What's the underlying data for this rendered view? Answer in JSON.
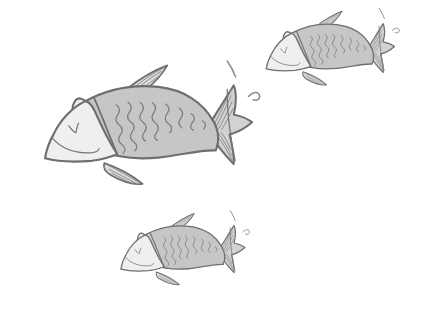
{
  "scene": {
    "title": "Three Fish Sketch",
    "background_color": "#ffffff",
    "width": 429,
    "height": 318,
    "style": "hand-drawn pencil sketch",
    "subject_count": 3
  },
  "palette": {
    "background": "#ffffff",
    "outline": "#6e6e6e",
    "body_fill": "#c6c6c6",
    "head_fill": "#efefef",
    "fin_fill": "#dcdcdc",
    "tail_fill": "#d2d2d2",
    "detail_line": "#7d7d7d",
    "splash_line": "#8d8d8d"
  },
  "fish": [
    {
      "id": "fish-large-left",
      "label": "Large fish, center left",
      "x": 27,
      "y": 73,
      "scale": 1.0,
      "rotation": -8,
      "facing": "left"
    },
    {
      "id": "fish-small-top-right",
      "label": "Small fish, top right",
      "x": 255,
      "y": 16,
      "scale": 0.62,
      "rotation": -8,
      "facing": "left"
    },
    {
      "id": "fish-small-bottom",
      "label": "Small fish, bottom center",
      "x": 110,
      "y": 218,
      "scale": 0.6,
      "rotation": -8,
      "facing": "left"
    }
  ],
  "fish_parts": [
    {
      "name": "head",
      "description": "pale rounded snout section"
    },
    {
      "name": "eye",
      "description": "small v-shaped check mark"
    },
    {
      "name": "mouth",
      "description": "curved smile line"
    },
    {
      "name": "gill-divider",
      "description": "vertical line separating head from body"
    },
    {
      "name": "body",
      "description": "gray tapering body with scale squiggles"
    },
    {
      "name": "scales",
      "description": "vertical zigzag squiggle columns"
    },
    {
      "name": "dorsal-fin",
      "description": "small swept triangular fin on top"
    },
    {
      "name": "pectoral-fin",
      "description": "pointed leaf-shaped fin below body"
    },
    {
      "name": "tail-fin",
      "description": "forked fan tail with ray lines"
    },
    {
      "name": "splash",
      "description": "two small water-splash ticks near tail"
    }
  ]
}
